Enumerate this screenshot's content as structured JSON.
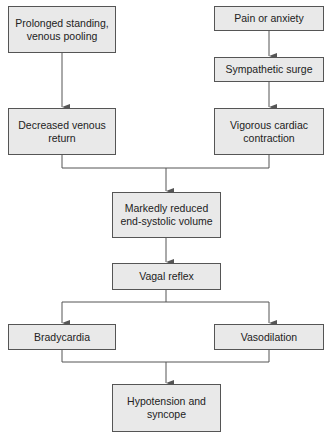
{
  "diagram": {
    "type": "flowchart",
    "colors": {
      "box_fill": "#e9e9e9",
      "box_border": "#555555",
      "line": "#555555",
      "text": "#222222"
    },
    "nodes": {
      "prolonged_standing": {
        "label": "Prolonged standing, venous pooling"
      },
      "pain_anxiety": {
        "label": "Pain or anxiety"
      },
      "sympathetic_surge": {
        "label": "Sympathetic surge"
      },
      "decreased_venous_return": {
        "label": "Decreased venous return"
      },
      "vigorous_contraction": {
        "label": "Vigorous cardiac contraction"
      },
      "reduced_esv": {
        "label": "Markedly reduced end-systolic volume"
      },
      "vagal_reflex": {
        "label": "Vagal reflex"
      },
      "bradycardia": {
        "label": "Bradycardia"
      },
      "vasodilation": {
        "label": "Vasodilation"
      },
      "hypotension_syncope": {
        "label": "Hypotension and syncope"
      }
    },
    "edges": [
      [
        "prolonged_standing",
        "decreased_venous_return"
      ],
      [
        "pain_anxiety",
        "sympathetic_surge"
      ],
      [
        "sympathetic_surge",
        "vigorous_contraction"
      ],
      [
        "decreased_venous_return",
        "reduced_esv"
      ],
      [
        "vigorous_contraction",
        "reduced_esv"
      ],
      [
        "reduced_esv",
        "vagal_reflex"
      ],
      [
        "vagal_reflex",
        "bradycardia"
      ],
      [
        "vagal_reflex",
        "vasodilation"
      ],
      [
        "bradycardia",
        "hypotension_syncope"
      ],
      [
        "vasodilation",
        "hypotension_syncope"
      ]
    ]
  }
}
